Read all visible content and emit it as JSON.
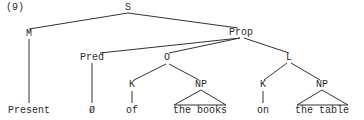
{
  "example_number": "(9)",
  "tree": {
    "root": "S",
    "nodes": {
      "S": "S",
      "M": "M",
      "Prop": "Prop",
      "Pred": "Pred",
      "O": "O",
      "L": "L",
      "K1": "K",
      "NP1": "NP",
      "K2": "K",
      "NP2": "NP"
    },
    "leaves": {
      "present": "Present",
      "empty": "Ø",
      "of": "of",
      "the_books": "the books",
      "on": "on",
      "the_table": "the table"
    },
    "structure": [
      {
        "parent": "S",
        "children": [
          "M",
          "Prop"
        ]
      },
      {
        "parent": "M",
        "children": [
          "Present"
        ]
      },
      {
        "parent": "Prop",
        "children": [
          "Pred",
          "O",
          "L"
        ]
      },
      {
        "parent": "Pred",
        "children": [
          "Ø"
        ]
      },
      {
        "parent": "O",
        "children": [
          "K",
          "NP"
        ]
      },
      {
        "parent": "K",
        "children": [
          "of"
        ]
      },
      {
        "parent": "NP",
        "children": [
          "the books"
        ],
        "triangle": true
      },
      {
        "parent": "L",
        "children": [
          "K",
          "NP"
        ]
      },
      {
        "parent": "K",
        "children": [
          "on"
        ]
      },
      {
        "parent": "NP",
        "children": [
          "the table"
        ],
        "triangle": true
      }
    ]
  },
  "colors": {
    "line": "#333333",
    "text": "#2a2a2a",
    "background": "#ffffff"
  }
}
